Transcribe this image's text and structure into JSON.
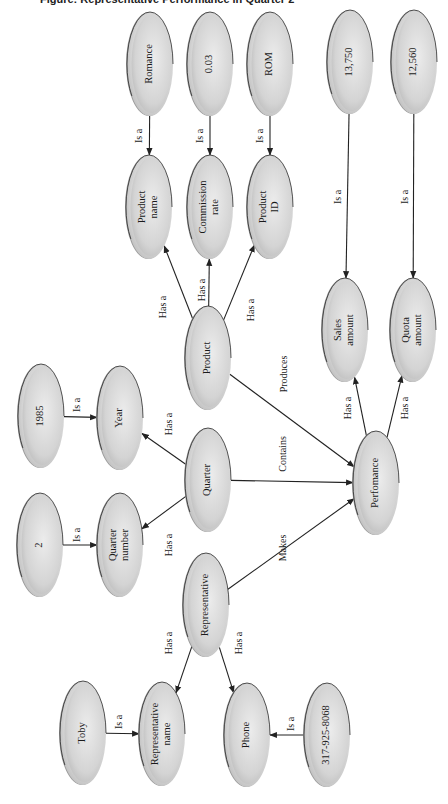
{
  "title": "Figure: Representative Performance in Quarter 2",
  "colors": {
    "node_fill_light": "#e6e6e6",
    "node_fill_dark": "#bdbdbd",
    "node_rim": "#9a9a9a",
    "node_outline": "#2a2a2a",
    "edge": "#222222"
  },
  "nodes": [
    {
      "id": "romance",
      "lines": [
        "Romance"
      ],
      "cx": 150,
      "cy": 64
    },
    {
      "id": "rate-value",
      "lines": [
        "0.03"
      ],
      "cx": 210,
      "cy": 64
    },
    {
      "id": "rom",
      "lines": [
        "ROM"
      ],
      "cx": 270,
      "cy": 64
    },
    {
      "id": "sales-value",
      "lines": [
        "13,750"
      ],
      "cx": 350,
      "cy": 62
    },
    {
      "id": "quota-value",
      "lines": [
        "12,560"
      ],
      "cx": 414,
      "cy": 62
    },
    {
      "id": "product-name",
      "lines": [
        "Product",
        "name"
      ],
      "cx": 149,
      "cy": 207
    },
    {
      "id": "commission-rate",
      "lines": [
        "Commission",
        "rate"
      ],
      "cx": 210,
      "cy": 207
    },
    {
      "id": "product-id",
      "lines": [
        "Product",
        "ID"
      ],
      "cx": 270,
      "cy": 207
    },
    {
      "id": "sales-amount",
      "lines": [
        "Sales",
        "amount"
      ],
      "cx": 345,
      "cy": 330
    },
    {
      "id": "quota-amount",
      "lines": [
        "Quota",
        "amount"
      ],
      "cx": 413,
      "cy": 330
    },
    {
      "id": "product",
      "lines": [
        "Product"
      ],
      "cx": 208,
      "cy": 358
    },
    {
      "id": "year-value",
      "lines": [
        "1985"
      ],
      "cx": 41,
      "cy": 416
    },
    {
      "id": "year",
      "lines": [
        "Year"
      ],
      "cx": 120,
      "cy": 418
    },
    {
      "id": "quarter",
      "lines": [
        "Quarter"
      ],
      "cx": 208,
      "cy": 480
    },
    {
      "id": "performance",
      "lines": [
        "Perfomance"
      ],
      "cx": 376,
      "cy": 483
    },
    {
      "id": "quarter-value",
      "lines": [
        "2"
      ],
      "cx": 40,
      "cy": 545
    },
    {
      "id": "quarter-number",
      "lines": [
        "Quarter",
        "number"
      ],
      "cx": 120,
      "cy": 545
    },
    {
      "id": "representative",
      "lines": [
        "Representative"
      ],
      "cx": 206,
      "cy": 605
    },
    {
      "id": "rep-name-value",
      "lines": [
        "Toby"
      ],
      "cx": 83,
      "cy": 733
    },
    {
      "id": "representative-name",
      "lines": [
        "Representative",
        "name"
      ],
      "cx": 162,
      "cy": 734
    },
    {
      "id": "phone",
      "lines": [
        "Phone"
      ],
      "cx": 247,
      "cy": 735
    },
    {
      "id": "phone-value",
      "lines": [
        "317-925-8068"
      ],
      "cx": 327,
      "cy": 735
    }
  ],
  "edges": [
    {
      "from": "romance",
      "to": "product-name",
      "label": "Is a",
      "lx": 140,
      "ly": 136
    },
    {
      "from": "rate-value",
      "to": "commission-rate",
      "label": "Is a",
      "lx": 201,
      "ly": 136
    },
    {
      "from": "rom",
      "to": "product-id",
      "label": "Is a",
      "lx": 261,
      "ly": 136
    },
    {
      "from": "sales-value",
      "to": "sales-amount",
      "label": "Is a",
      "lx": 339,
      "ly": 197
    },
    {
      "from": "quota-value",
      "to": "quota-amount",
      "label": "Is a",
      "lx": 406,
      "ly": 197
    },
    {
      "from": "product",
      "to": "product-name",
      "label": "Has a",
      "lx": 164,
      "ly": 307
    },
    {
      "from": "product",
      "to": "commission-rate",
      "label": "Has a",
      "lx": 203,
      "ly": 290
    },
    {
      "from": "product",
      "to": "product-id",
      "label": "Has a",
      "lx": 252,
      "ly": 310
    },
    {
      "from": "product",
      "to": "performance",
      "label": "Produces",
      "lx": 285,
      "ly": 374
    },
    {
      "from": "performance",
      "to": "sales-amount",
      "label": "Has a",
      "lx": 349,
      "ly": 408
    },
    {
      "from": "performance",
      "to": "quota-amount",
      "label": "Has a",
      "lx": 406,
      "ly": 408
    },
    {
      "from": "year-value",
      "to": "year",
      "label": "Is a",
      "lx": 78,
      "ly": 405
    },
    {
      "from": "quarter",
      "to": "year",
      "label": "Has a",
      "lx": 170,
      "ly": 424
    },
    {
      "from": "quarter",
      "to": "performance",
      "label": "Contains",
      "lx": 284,
      "ly": 454
    },
    {
      "from": "quarter",
      "to": "quarter-number",
      "label": "Has a",
      "lx": 170,
      "ly": 545
    },
    {
      "from": "quarter-value",
      "to": "quarter-number",
      "label": "Is a",
      "lx": 78,
      "ly": 535
    },
    {
      "from": "representative",
      "to": "performance",
      "label": "Makes",
      "lx": 284,
      "ly": 548
    },
    {
      "from": "representative",
      "to": "representative-name",
      "label": "Has a",
      "lx": 170,
      "ly": 643
    },
    {
      "from": "representative",
      "to": "phone",
      "label": "Has a",
      "lx": 240,
      "ly": 643
    },
    {
      "from": "rep-name-value",
      "to": "representative-name",
      "label": "Is a",
      "lx": 120,
      "ly": 722
    },
    {
      "from": "phone-value",
      "to": "phone",
      "label": "Is a",
      "lx": 292,
      "ly": 724
    }
  ]
}
